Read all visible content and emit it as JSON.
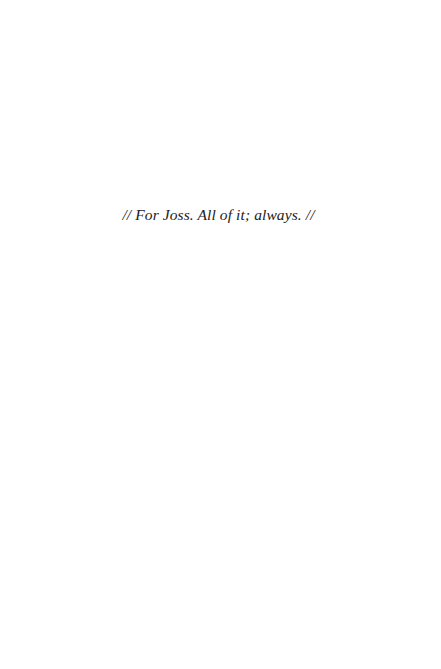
{
  "page": {
    "type": "dedication",
    "background_color": "#ffffff",
    "text_color": "#222222"
  },
  "dedication": {
    "text": "// For Joss. All of it; always. //"
  }
}
